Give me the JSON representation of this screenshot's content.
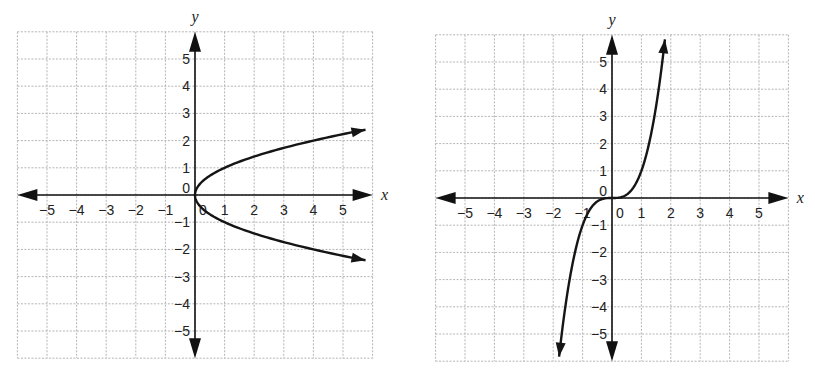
{
  "chart_data": [
    {
      "type": "line",
      "title": "",
      "equation": "x = y^2",
      "xlabel": "x",
      "ylabel": "y",
      "xlim": [
        -6,
        6
      ],
      "ylim": [
        -6,
        6
      ],
      "grid": true,
      "x_ticks": [
        "-5",
        "-4",
        "-3",
        "-2",
        "-1",
        "0",
        "1",
        "2",
        "3",
        "4",
        "5"
      ],
      "y_ticks": [
        "5",
        "4",
        "3",
        "2",
        "1",
        "0",
        "-1",
        "-2",
        "-3",
        "-4",
        "-5"
      ],
      "series": [
        {
          "name": "curve",
          "points": [
            [
              5.76,
              2.4
            ],
            [
              4,
              2
            ],
            [
              2.25,
              1.5
            ],
            [
              1,
              1
            ],
            [
              0.25,
              0.5
            ],
            [
              0,
              0
            ],
            [
              0.25,
              -0.5
            ],
            [
              1,
              -1
            ],
            [
              2.25,
              -1.5
            ],
            [
              4,
              -2
            ],
            [
              5.76,
              -2.4
            ]
          ],
          "arrows": "both ends"
        }
      ]
    },
    {
      "type": "line",
      "title": "",
      "equation": "y = x^3",
      "xlabel": "x",
      "ylabel": "y",
      "xlim": [
        -6,
        6
      ],
      "ylim": [
        -6,
        6
      ],
      "grid": true,
      "x_ticks": [
        "-5",
        "-4",
        "-3",
        "-2",
        "-1",
        "0",
        "1",
        "2",
        "3",
        "4",
        "5"
      ],
      "y_ticks": [
        "5",
        "4",
        "3",
        "2",
        "1",
        "0",
        "-1",
        "-2",
        "-3",
        "-4",
        "-5"
      ],
      "series": [
        {
          "name": "curve",
          "points": [
            [
              -1.8,
              -5.83
            ],
            [
              -1.5,
              -3.375
            ],
            [
              -1,
              -1
            ],
            [
              -0.5,
              -0.125
            ],
            [
              0,
              0
            ],
            [
              0.5,
              0.125
            ],
            [
              1,
              1
            ],
            [
              1.5,
              3.375
            ],
            [
              1.8,
              5.83
            ]
          ],
          "arrows": "both ends"
        }
      ]
    }
  ],
  "charts": {
    "left": {
      "x_axis_label": "x",
      "y_axis_label": "y",
      "origin_label": "0"
    },
    "right": {
      "x_axis_label": "x",
      "y_axis_label": "y",
      "origin_label": "0"
    }
  }
}
